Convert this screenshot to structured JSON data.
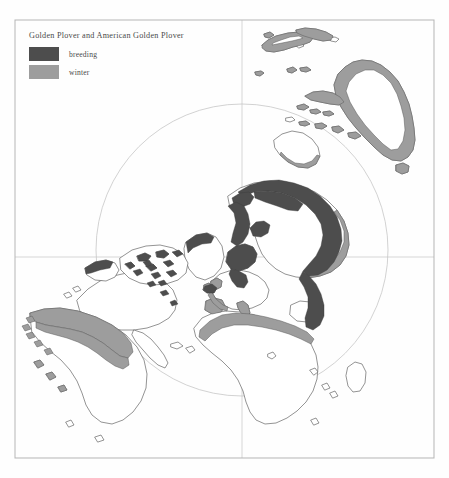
{
  "figure": {
    "title": "Golden Plover and American Golden Plover",
    "projection_note": "polar-centred world map",
    "frame": {
      "x": 15,
      "y": 20,
      "width": 419,
      "height": 438
    },
    "graticule": {
      "vertical_x": 242,
      "horizontal_y": 257
    },
    "circle": {
      "cx": 242,
      "cy": 250,
      "r": 146
    }
  },
  "legend": {
    "items": [
      {
        "label": "breeding",
        "color": "#4d4d4d",
        "name": "breeding"
      },
      {
        "label": "winter",
        "color": "#9d9d9d",
        "name": "winter"
      }
    ]
  },
  "colors": {
    "breeding": "#4d4d4d",
    "winter": "#9d9d9d",
    "coastline": "#5a5a5a",
    "graticule": "#c9c9c9",
    "circle": "#c4c4c4",
    "frame": "#b5b5b5",
    "background": "#fefefe",
    "text": "#4a4a4a"
  },
  "regions": {
    "breeding_areas": [
      "Arctic Siberia",
      "Taymyr Peninsula",
      "Novaya Zemlya",
      "Scandinavia / Fennoscandia",
      "Iceland",
      "Greenland west coast",
      "Canadian Arctic Archipelago",
      "Alaska north slope"
    ],
    "winter_areas": [
      "Western Europe coasts",
      "Mediterranean / North Africa",
      "Australia coasts",
      "New Zealand",
      "Southern South America",
      "Pacific islands"
    ]
  }
}
